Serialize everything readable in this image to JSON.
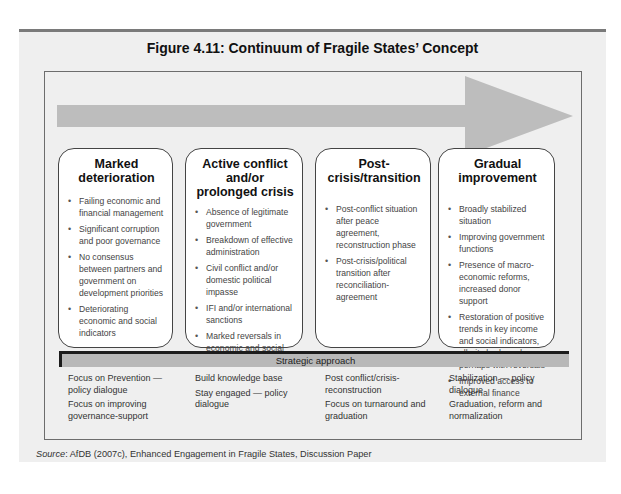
{
  "figure": {
    "title": "Figure 4.11: Continuum of Fragile States’ Concept",
    "arrow_color": "#bdbdbd",
    "panel_color": "#efefef",
    "columns": [
      {
        "heading": "Marked deterioration",
        "bullets": [
          "Failing economic and financial management",
          "Significant corruption and poor governance",
          "No consensus between partners and government on development priorities",
          "Deteriorating economic and social indicators"
        ]
      },
      {
        "heading": "Active conflict and/or prolonged crisis",
        "bullets": [
          "Absence of legitimate government",
          "Breakdown of effective administration",
          "Civil conflict and/or domestic political impasse",
          "IFI and/or international sanctions",
          "Marked reversals in economic and social indicators"
        ]
      },
      {
        "heading": "Post-crisis/transition",
        "bullets": [
          "Post-conflict situation after peace agreement, reconstruction phase",
          "Post-crisis/political transition after reconciliation-agreement"
        ]
      },
      {
        "heading": "Gradual improvement",
        "bullets": [
          "Broadly stabilized situation",
          "Improving government functions",
          "Presence of macro-economic reforms, increased donor support",
          "Restoration of positive trends in key income and social indicators, albeit slowly and perhaps with reversals",
          "Improved access to external finance"
        ]
      }
    ],
    "strategic_approach": {
      "label": "Strategic approach",
      "columns": [
        [
          "Focus on Prevention — policy dialogue",
          "Focus on improving governance-support"
        ],
        [
          "Build knowledge base",
          "Stay engaged — policy dialogue"
        ],
        [
          "Post conflict/crisis-reconstruction",
          "Focus on turnaround and graduation"
        ],
        [
          "Stabilization — policy dialogue",
          "Graduation, reform and normalization"
        ]
      ]
    }
  },
  "source": {
    "label": "Source",
    "text": ": AfDB (2007c), Enhanced Engagement in Fragile States, Discussion Paper"
  }
}
